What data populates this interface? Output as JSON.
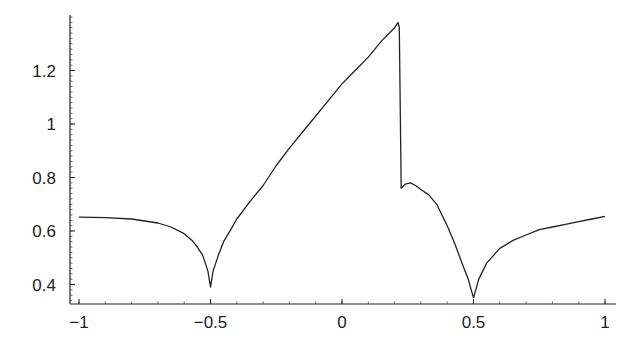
{
  "chart_data": {
    "type": "line",
    "title": "",
    "xlabel": "",
    "ylabel": "",
    "xlim": [
      -1.05,
      1.04
    ],
    "ylim": [
      0.33,
      1.41
    ],
    "grid": false,
    "legend": null,
    "x_ticks": [
      -1,
      -0.5,
      0,
      0.5,
      1
    ],
    "x_tick_labels": [
      "−1",
      "−0.5",
      "0",
      "0.5",
      "1"
    ],
    "y_ticks": [
      0.4,
      0.6,
      0.8,
      1,
      1.2
    ],
    "y_tick_labels": [
      "0.4",
      "0.6",
      "0.8",
      "1",
      "1.2"
    ],
    "series": [
      {
        "name": "curve",
        "color": "#222222",
        "x": [
          -1.0,
          -0.9,
          -0.8,
          -0.7,
          -0.65,
          -0.6,
          -0.57,
          -0.55,
          -0.53,
          -0.51,
          -0.5,
          -0.49,
          -0.47,
          -0.45,
          -0.42,
          -0.4,
          -0.35,
          -0.3,
          -0.25,
          -0.2,
          -0.15,
          -0.1,
          -0.05,
          0.0,
          0.05,
          0.1,
          0.15,
          0.2,
          0.213,
          0.218,
          0.225,
          0.24,
          0.26,
          0.28,
          0.3,
          0.33,
          0.36,
          0.4,
          0.43,
          0.46,
          0.48,
          0.5,
          0.52,
          0.55,
          0.6,
          0.65,
          0.7,
          0.75,
          0.8,
          0.85,
          0.9,
          0.95,
          1.0
        ],
        "y": [
          0.652,
          0.65,
          0.645,
          0.63,
          0.615,
          0.59,
          0.565,
          0.54,
          0.51,
          0.45,
          0.39,
          0.45,
          0.51,
          0.56,
          0.61,
          0.645,
          0.71,
          0.77,
          0.845,
          0.91,
          0.97,
          1.03,
          1.09,
          1.15,
          1.2,
          1.25,
          1.31,
          1.36,
          1.38,
          1.36,
          0.76,
          0.775,
          0.78,
          0.77,
          0.755,
          0.735,
          0.7,
          0.62,
          0.55,
          0.47,
          0.42,
          0.35,
          0.42,
          0.48,
          0.535,
          0.565,
          0.585,
          0.605,
          0.615,
          0.625,
          0.635,
          0.645,
          0.655
        ]
      }
    ]
  }
}
